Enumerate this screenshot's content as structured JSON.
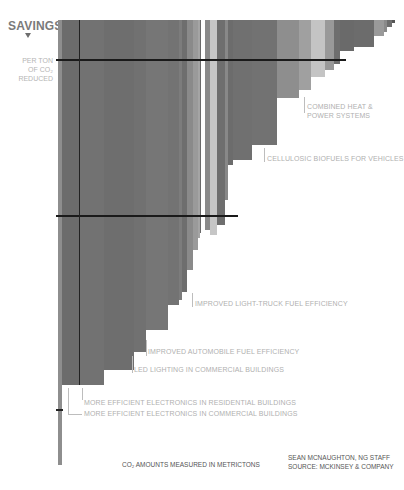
{
  "chart_data": {
    "type": "bar",
    "subtype": "inverted marginal abatement curve (variable-width bars)",
    "title": "SAVINGS",
    "ylabel": "PER TON OF CO2 REDUCED",
    "xlabel": "CO2 AMOUNTS MEASURED IN METRICTONS",
    "grid": false,
    "bars": [
      {
        "x": 58,
        "w": 4,
        "bottom": 465,
        "color": "#8e8e8e"
      },
      {
        "x": 62,
        "w": 17,
        "bottom": 385,
        "color": "#6c6c6c"
      },
      {
        "x": 79,
        "w": 25,
        "bottom": 385,
        "color": "#727272"
      },
      {
        "x": 104,
        "w": 30,
        "bottom": 370,
        "color": "#6e6e6e"
      },
      {
        "x": 134,
        "w": 12,
        "bottom": 352,
        "color": "#717171"
      },
      {
        "x": 146,
        "w": 22,
        "bottom": 330,
        "color": "#767676"
      },
      {
        "x": 168,
        "w": 11,
        "bottom": 305,
        "color": "#737373"
      },
      {
        "x": 179,
        "w": 3,
        "bottom": 300,
        "color": "#7c7c7c"
      },
      {
        "x": 182,
        "w": 5,
        "bottom": 292,
        "color": "#6e6e6e"
      },
      {
        "x": 187,
        "w": 6,
        "bottom": 270,
        "color": "#8a8a8a"
      },
      {
        "x": 193,
        "w": 5,
        "bottom": 250,
        "color": "#9a9a9a"
      },
      {
        "x": 198,
        "w": 2,
        "bottom": 238,
        "color": "#a5a5a5"
      },
      {
        "x": 200,
        "w": 1,
        "bottom": 233,
        "color": "#6a6a6a"
      },
      {
        "x": 205,
        "w": 5,
        "bottom": 230,
        "color": "#8a8a8a"
      },
      {
        "x": 210,
        "w": 7,
        "bottom": 235,
        "color": "#c6c6c6"
      },
      {
        "x": 217,
        "w": 8,
        "bottom": 225,
        "color": "#6e6e6e"
      },
      {
        "x": 225,
        "w": 3,
        "bottom": 200,
        "color": "#888888"
      },
      {
        "x": 228,
        "w": 5,
        "bottom": 165,
        "color": "#6c6c6c"
      },
      {
        "x": 233,
        "w": 19,
        "bottom": 160,
        "color": "#707070"
      },
      {
        "x": 252,
        "w": 25,
        "bottom": 145,
        "color": "#727272"
      },
      {
        "x": 277,
        "w": 22,
        "bottom": 98,
        "color": "#8e8e8e"
      },
      {
        "x": 299,
        "w": 12,
        "bottom": 90,
        "color": "#a0a0a0"
      },
      {
        "x": 311,
        "w": 14,
        "bottom": 77,
        "color": "#c4c4c4"
      },
      {
        "x": 325,
        "w": 9,
        "bottom": 70,
        "color": "#999999"
      },
      {
        "x": 334,
        "w": 6,
        "bottom": 64,
        "color": "#6e6e6e"
      },
      {
        "x": 340,
        "w": 14,
        "bottom": 51,
        "color": "#6a6a6a"
      },
      {
        "x": 354,
        "w": 20,
        "bottom": 47,
        "color": "#6c6c6c"
      },
      {
        "x": 374,
        "w": 10,
        "bottom": 36,
        "color": "#9a9a9a"
      },
      {
        "x": 384,
        "w": 3,
        "bottom": 32,
        "color": "#8a8a8a"
      },
      {
        "x": 387,
        "w": 5,
        "bottom": 27,
        "color": "#6e6e6e"
      },
      {
        "x": 392,
        "w": 3,
        "bottom": 23,
        "color": "#555555"
      }
    ],
    "reference_lines": [
      {
        "orientation": "horizontal",
        "y": 59,
        "x1": 56,
        "x2": 346
      },
      {
        "orientation": "horizontal",
        "y": 215,
        "x1": 56,
        "x2": 238
      },
      {
        "orientation": "vertical",
        "x": 79,
        "y1": 20,
        "y2": 385
      }
    ],
    "annotations": [
      {
        "text": "COMBINED HEAT & POWER SYSTEMS",
        "x": 304,
        "y": 96
      },
      {
        "text": "CELLULOSIC BIOFUELS FOR VEHICLES",
        "x": 266,
        "y": 158
      },
      {
        "text": "IMPROVED LIGHT-TRUCK FUEL EFFICIENCY",
        "x": 193,
        "y": 302
      },
      {
        "text": "IMPROVED AUTOMOBILE FUEL EFFICIENCY",
        "x": 147,
        "y": 350
      },
      {
        "text": "LED LIGHTING IN COMMERCIAL BUILDINGS",
        "x": 133,
        "y": 370
      },
      {
        "text": "MORE EFFICIENT ELECTRONICS IN RESIDENTIAL BUILDINGS",
        "x": 82,
        "y": 402
      },
      {
        "text": "MORE EFFICIENT ELECTRONICS IN COMMERCIAL BUILDINGS",
        "x": 82,
        "y": 413
      }
    ]
  },
  "header": {
    "title": "SAVINGS",
    "unit_lines": [
      "PER TON",
      "OF CO₂",
      "REDUCED"
    ]
  },
  "labels": {
    "chp": [
      "COMBINED HEAT &",
      "POWER SYSTEMS"
    ],
    "biofuels": "CELLULOSIC BIOFUELS FOR VEHICLES",
    "light_truck": "IMPROVED LIGHT-TRUCK FUEL EFFICIENCY",
    "automobile": "IMPROVED AUTOMOBILE FUEL EFFICIENCY",
    "led": "LED LIGHTING IN COMMERCIAL BUILDINGS",
    "residential": "MORE EFFICIENT ELECTRONICS IN RESIDENTIAL BUILDINGS",
    "commercial": "MORE EFFICIENT ELECTRONICS IN COMMERCIAL BUILDINGS"
  },
  "footer": {
    "measure": "CO₂ AMOUNTS MEASURED IN METRICTONS",
    "credit": "SEAN MCNAUGHTON, NG STAFF",
    "source": "SOURCE: MCKINSEY & COMPANY"
  }
}
